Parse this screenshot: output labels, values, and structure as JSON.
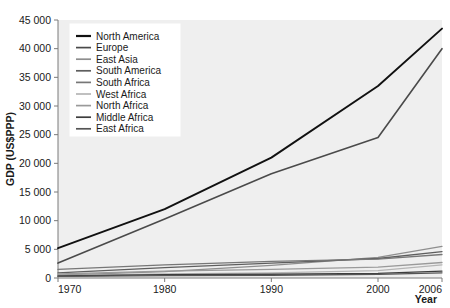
{
  "chart_data": {
    "type": "line",
    "title": "",
    "xlabel": "Year",
    "ylabel": "GDP (US$PPP)",
    "x": [
      1970,
      1980,
      1990,
      2000,
      2006
    ],
    "xlim": [
      1970,
      2006
    ],
    "ylim": [
      0,
      45000
    ],
    "xticks": [
      "1970",
      "1980",
      "1990",
      "2000",
      "2006"
    ],
    "yticks": [
      "0",
      "5 000",
      "10 000",
      "15 000",
      "20 000",
      "25 000",
      "30 000",
      "35 000",
      "40 000",
      "45 000"
    ],
    "ytick_values": [
      0,
      5000,
      10000,
      15000,
      20000,
      25000,
      30000,
      35000,
      40000,
      45000
    ],
    "grid": false,
    "legend_position": "top-left",
    "background": "#efefef",
    "series": [
      {
        "name": "North America",
        "color": "#111111",
        "width": 1.9,
        "values": [
          5200,
          12000,
          21000,
          33500,
          43500
        ]
      },
      {
        "name": "Europe",
        "color": "#4a4a4a",
        "width": 1.6,
        "values": [
          2600,
          10300,
          18200,
          24500,
          40000
        ]
      },
      {
        "name": "East Asia",
        "color": "#8e8e8e",
        "width": 1.3,
        "values": [
          500,
          1100,
          2200,
          3600,
          5500
        ]
      },
      {
        "name": "South America",
        "color": "#5e5e5e",
        "width": 1.3,
        "values": [
          900,
          1800,
          2600,
          3400,
          4600
        ]
      },
      {
        "name": "South Africa",
        "color": "#777777",
        "width": 1.3,
        "values": [
          1500,
          2300,
          2900,
          3300,
          4100
        ]
      },
      {
        "name": "West Africa",
        "color": "#b5b5b5",
        "width": 1.3,
        "values": [
          400,
          700,
          900,
          1300,
          2300
        ]
      },
      {
        "name": "North Africa",
        "color": "#9a9a9a",
        "width": 1.3,
        "values": [
          700,
          1200,
          1500,
          1900,
          2700
        ]
      },
      {
        "name": "Middle Africa",
        "color": "#3d3d3d",
        "width": 1.3,
        "values": [
          350,
          600,
          650,
          800,
          1200
        ]
      },
      {
        "name": "East Africa",
        "color": "#555555",
        "width": 1.3,
        "values": [
          300,
          420,
          480,
          620,
          900
        ]
      }
    ]
  }
}
